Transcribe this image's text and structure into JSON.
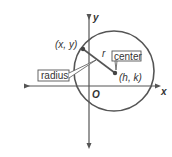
{
  "diagram": {
    "axes": {
      "x_label": "x",
      "y_label": "y",
      "origin_label": "O"
    },
    "points": {
      "on_circle": "(x, y)",
      "center": "(h, k)"
    },
    "radius_symbol": "r",
    "callouts": {
      "center": "center",
      "radius": "radius"
    },
    "colors": {
      "stroke": "#555555",
      "text": "#333333",
      "background": "#ffffff"
    }
  }
}
